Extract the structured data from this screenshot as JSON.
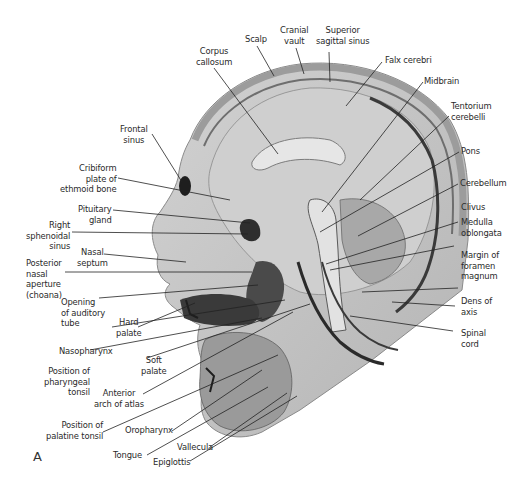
{
  "figure": {
    "panel_letter": "A",
    "colors": {
      "background": "#ffffff",
      "tissue": "#c8c8c8",
      "tissue_dark": "#7a7a7a",
      "text": "#2a2a2a",
      "leader": "#222222"
    }
  },
  "labels": {
    "scalp": "Scalp",
    "cranial_vault": "Cranial\nvault",
    "superior_sagittal_sinus": "Superior\nsagittal sinus",
    "corpus_callosum": "Corpus\ncallosum",
    "falx_cerebri": "Falx cerebri",
    "midbrain": "Midbrain",
    "tentorium_cerebelli": "Tentorium\ncerebelli",
    "pons": "Pons",
    "cerebellum": "Cerebellum",
    "clivus": "Clivus",
    "medulla_oblongata": "Medulla\noblongata",
    "margin_foramen_magnum": "Margin of\nforamen\nmagnum",
    "dens_of_axis": "Dens of\naxis",
    "spinal_cord": "Spinal\ncord",
    "frontal_sinus": "Frontal\nsinus",
    "cribiform_plate": "Cribiform\nplate of\nethmoid bone",
    "pituitary_gland": "Pituitary\ngland",
    "right_sphenoidal_sinus": "Right\nsphenoidal\nsinus",
    "nasal_septum": "Nasal\nseptum",
    "posterior_nasal_aperture": "Posterior\nnasal\naperture\n(choana)",
    "opening_auditory_tube": "Opening\nof auditory\ntube",
    "hard_palate": "Hard\npalate",
    "nasopharynx": "Nasopharynx",
    "soft_palate": "Soft\npalate",
    "position_pharyngeal_tonsil": "Position of\npharyngeal\ntonsil",
    "anterior_arch_atlas": "Anterior\narch of atlas",
    "position_palatine_tonsil": "Position of\npalatine tonsil",
    "oropharynx": "Oropharynx",
    "tongue": "Tongue",
    "vallecula": "Vallecula",
    "epiglottis": "Epiglottis"
  }
}
